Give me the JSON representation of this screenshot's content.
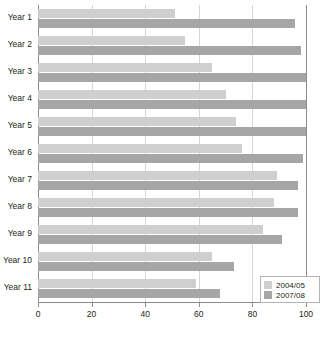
{
  "chart_data": {
    "type": "bar",
    "orientation": "horizontal",
    "title": "",
    "subtitle": "",
    "xlabel": "",
    "ylabel": "",
    "xlim": [
      0,
      100
    ],
    "xticks": [
      0,
      20,
      40,
      60,
      80,
      100
    ],
    "xtick_labels": [
      "0",
      "20",
      "40",
      "60",
      "80",
      "100"
    ],
    "grid": true,
    "grid_axis": "x",
    "legend_position": "bottom-right",
    "categories": [
      "Year 1",
      "Year 2",
      "Year 3",
      "Year 4",
      "Year 5",
      "Year 6",
      "Year 7",
      "Year 8",
      "Year 9",
      "Year 10",
      "Year 11"
    ],
    "series": [
      {
        "name": "2004/05",
        "color": "#cfcfcf",
        "values": [
          51,
          55,
          65,
          70,
          74,
          76,
          89,
          88,
          84,
          65,
          59
        ]
      },
      {
        "name": "2007/08",
        "color": "#a6a6a6",
        "values": [
          96,
          98,
          100,
          100,
          100,
          99,
          97,
          97,
          91,
          73,
          68
        ]
      }
    ]
  },
  "legend": {
    "items": [
      {
        "label": "2004/05",
        "color": "#cfcfcf"
      },
      {
        "label": "2007/08",
        "color": "#a6a6a6"
      }
    ]
  },
  "colors": {
    "series_light": "#cfcfcf",
    "series_dark": "#a6a6a6",
    "axis": "#8c8c8c",
    "grid": "#d6d6d6",
    "text": "#231f20",
    "background": "#ffffff"
  }
}
